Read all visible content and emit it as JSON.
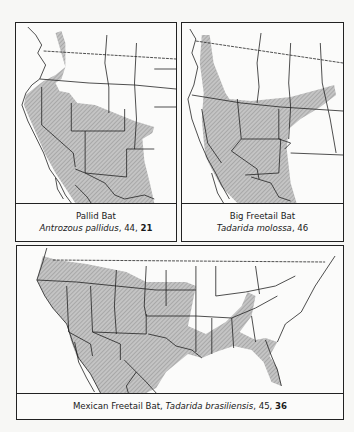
{
  "maps": [
    {
      "common_name": "Pallid Bat",
      "scientific_name": "Antrozous pallidus",
      "page_ref": "44",
      "plate_ref": "21",
      "range_region": "western North America: eastern Washington/Oregon south through the Great Basin, California, Southwest and into Mexico, east to western Texas and Oklahoma"
    },
    {
      "common_name": "Big Freetail Bat",
      "scientific_name": "Tadarida molossa",
      "page_ref": "46",
      "range_region": "southwestern US from Utah and Nevada to Texas and Kansas, south into Mexico"
    },
    {
      "common_name": "Mexican Freetail Bat",
      "scientific_name": "Tadarida brasiliensis",
      "page_ref": "45",
      "plate_ref": "36",
      "range_region": "southern and western US from Oregon to Florida and north to Nebraska/Kentucky, south through Mexico"
    }
  ],
  "style": {
    "range_fill": "#bdbdbd",
    "hatch_color": "#8a8a8a",
    "border_color": "#222222"
  }
}
